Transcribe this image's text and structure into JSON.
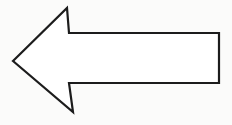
{
  "figure": {
    "background_color": "#fbfbfa"
  },
  "arrow": {
    "name": "left-pointing arrow",
    "direction": "left",
    "points": "13,61 67,8 69,33 219,33 219,83 69,83 73,112",
    "fill": "#ffffff",
    "stroke": "#1c1c1c",
    "stroke_width": "2.2"
  }
}
